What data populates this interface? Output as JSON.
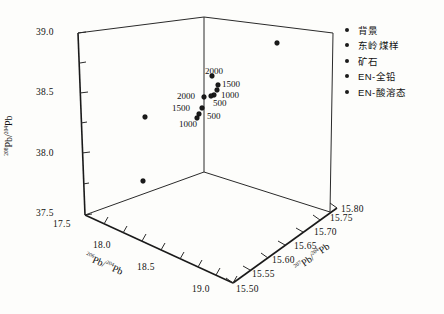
{
  "chart_data": {
    "type": "scatter",
    "projection": "3d",
    "title": "",
    "xlabel": "206Pb/204Pb",
    "ylabel": "208Pb/204Pb",
    "zlabel": "207Pb/204Pb",
    "xlabel_parts": {
      "sup": "206",
      "base": "Pb/",
      "sup2": "204",
      "base2": "Pb"
    },
    "ylabel_parts": {
      "sup": "208",
      "base": "Pb/",
      "sup2": "204",
      "base2": "Pb"
    },
    "zlabel_parts": {
      "sup": "207",
      "base": "Pb/",
      "sup2": "204",
      "base2": "Pb"
    },
    "xlim": [
      17.5,
      19.0
    ],
    "ylim": [
      37.5,
      39.0
    ],
    "zlim": [
      15.5,
      15.8
    ],
    "xticks": [
      "17.5",
      "18.0",
      "18.5",
      "19.0"
    ],
    "yticks": [
      "37.5",
      "38.0",
      "38.5",
      "39.0"
    ],
    "zticks": [
      "15.50",
      "15.55",
      "15.60",
      "15.65",
      "15.70",
      "15.75",
      "15.80"
    ],
    "grid": false,
    "legend_position": "right",
    "series": [
      {
        "name": "背景",
        "marker": "circle",
        "color": "#1b1b1b"
      },
      {
        "name": "东岭煤样",
        "marker": "circle",
        "color": "#1b1b1b"
      },
      {
        "name": "矿石",
        "marker": "circle",
        "color": "#1b1b1b"
      },
      {
        "name": "EN-全铅",
        "marker": "circle",
        "color": "#1b1b1b"
      },
      {
        "name": "EN-酸溶态",
        "marker": "circle",
        "color": "#1b1b1b"
      }
    ],
    "points": [
      {
        "px": 277,
        "py": 43,
        "label": "",
        "series": "背景"
      },
      {
        "px": 145,
        "py": 117,
        "label": "",
        "series": "背景"
      },
      {
        "px": 143,
        "py": 181,
        "label": "",
        "series": "矿石"
      },
      {
        "px": 212,
        "py": 76,
        "label": "2000",
        "series": "EN-全铅"
      },
      {
        "px": 218,
        "py": 85,
        "label": "1500",
        "series": "EN-全铅"
      },
      {
        "px": 217,
        "py": 90,
        "label": "",
        "series": "EN-全铅"
      },
      {
        "px": 214,
        "py": 95,
        "label": "1000",
        "series": "EN-全铅"
      },
      {
        "px": 211,
        "py": 96,
        "label": "500",
        "series": "EN-全铅"
      },
      {
        "px": 204,
        "py": 97,
        "label": "2000",
        "series": "EN-酸溶态"
      },
      {
        "px": 202,
        "py": 108,
        "label": "1500",
        "series": "EN-酸溶态"
      },
      {
        "px": 199,
        "py": 114,
        "label": "500",
        "series": "EN-酸溶态"
      },
      {
        "px": 197,
        "py": 118,
        "label": "1000",
        "series": "EN-酸溶态"
      }
    ],
    "point_labels": [
      {
        "text": "2000",
        "x": 205,
        "y": 66
      },
      {
        "text": "1500",
        "x": 222,
        "y": 79
      },
      {
        "text": "1000",
        "x": 221,
        "y": 90
      },
      {
        "text": "500",
        "x": 213,
        "y": 98
      },
      {
        "text": "2000",
        "x": 177,
        "y": 91
      },
      {
        "text": "1500",
        "x": 172,
        "y": 103
      },
      {
        "text": "500",
        "x": 207,
        "y": 111
      },
      {
        "text": "1000",
        "x": 179,
        "y": 119
      }
    ]
  },
  "axes": {
    "y_tick_labels": [
      {
        "text": "39.0",
        "x": 36,
        "y": 27
      },
      {
        "text": "38.5",
        "x": 36,
        "y": 87
      },
      {
        "text": "38.0",
        "x": 36,
        "y": 148
      },
      {
        "text": "37.5",
        "x": 36,
        "y": 208
      }
    ],
    "x_tick_labels": [
      {
        "text": "17.5",
        "x": 53,
        "y": 219
      },
      {
        "text": "18.0",
        "x": 93,
        "y": 240
      },
      {
        "text": "18.5",
        "x": 137,
        "y": 262
      },
      {
        "text": "19.0",
        "x": 192,
        "y": 284
      }
    ],
    "z_tick_labels": [
      {
        "text": "15.50",
        "x": 236,
        "y": 284
      },
      {
        "text": "15.55",
        "x": 252,
        "y": 269
      },
      {
        "text": "15.60",
        "x": 272,
        "y": 255
      },
      {
        "text": "15.65",
        "x": 294,
        "y": 241
      },
      {
        "text": "15.70",
        "x": 314,
        "y": 227
      },
      {
        "text": "15.75",
        "x": 330,
        "y": 213
      },
      {
        "text": "15.80",
        "x": 341,
        "y": 204
      }
    ]
  },
  "legend": {
    "items": [
      {
        "label": "背景"
      },
      {
        "label": "东岭煤样"
      },
      {
        "label": "矿石"
      },
      {
        "label": "EN-全铅"
      },
      {
        "label": "EN-酸溶态"
      }
    ]
  }
}
